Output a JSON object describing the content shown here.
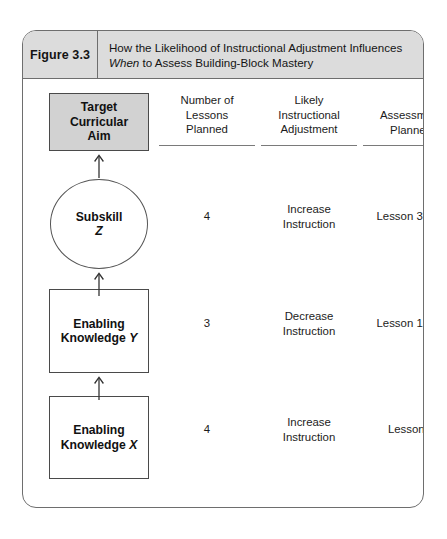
{
  "figure": {
    "number": "Figure 3.3",
    "title_line_1": "How the Likelihood of Instructional Adjustment Influences",
    "title_line_2_italic": "When",
    "title_line_2_rest": " to Assess Building-Block Mastery"
  },
  "columns": {
    "lessons": {
      "line1": "Number of",
      "line2": "Lessons",
      "line3": "Planned"
    },
    "adjustment": {
      "line1": "Likely",
      "line2": "Instructional",
      "line3": "Adjustment"
    },
    "assessment": {
      "line1": "Assessment",
      "line2": "Planned"
    }
  },
  "chain": {
    "target": {
      "line1": "Target",
      "line2": "Curricular",
      "line3": "Aim",
      "shape": "rectangle",
      "fill": "#d2d2d2"
    },
    "subskill": {
      "line1": "Subskill",
      "line2_italic": "Z",
      "shape": "circle",
      "fill": "#ffffff"
    },
    "knowledge_y": {
      "line1": "Enabling",
      "line2": "Knowledge ",
      "line2_italic": "Y",
      "shape": "rectangle",
      "fill": "#ffffff"
    },
    "knowledge_x": {
      "line1": "Enabling",
      "line2": "Knowledge ",
      "line2_italic": "X",
      "shape": "rectangle",
      "fill": "#ffffff"
    }
  },
  "rows": [
    {
      "node": "Subskill Z",
      "lessons_planned": "4",
      "adjustment_line1": "Increase",
      "adjustment_line2": "Instruction",
      "assessment_planned": "Lesson 3 or 4"
    },
    {
      "node": "Enabling Knowledge Y",
      "lessons_planned": "3",
      "adjustment_line1": "Decrease",
      "adjustment_line2": "Instruction",
      "assessment_planned": "Lesson 1 or 2"
    },
    {
      "node": "Enabling Knowledge X",
      "lessons_planned": "4",
      "adjustment_line1": "Increase",
      "adjustment_line2": "Instruction",
      "assessment_planned": "Lesson 4"
    }
  ],
  "arrows": {
    "direction": "up",
    "count": 3,
    "color": "#333333"
  },
  "colors": {
    "header_band": "#dcdcdc",
    "frame_border": "#6e6e6e",
    "target_fill": "#d2d2d2",
    "text": "#141414"
  }
}
